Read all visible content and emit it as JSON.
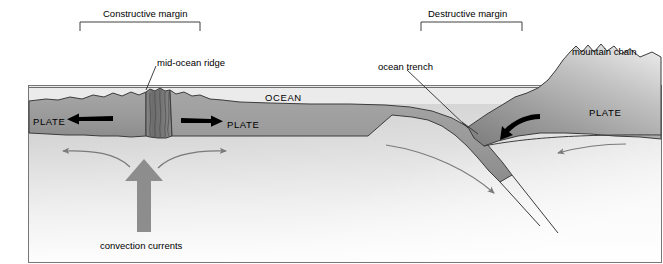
{
  "figure": {
    "kind": "cross-section-diagram",
    "background_color": "#ffffff",
    "frame_color": "#6e6e6e"
  },
  "annotations": {
    "constructive_margin": {
      "label": "Constructive margin",
      "bracket": {
        "left": 80,
        "right": 200,
        "top": 22,
        "tick": 9
      },
      "label_x": 103,
      "label_y": 9
    },
    "destructive_margin": {
      "label": "Destructive margin",
      "bracket": {
        "left": 421,
        "right": 522,
        "top": 22,
        "tick": 9
      },
      "label_x": 428,
      "label_y": 9
    }
  },
  "labels": {
    "mid_ocean_ridge": {
      "text": "mid-ocean ridge",
      "x": 157,
      "y": 58
    },
    "ocean": {
      "text": "OCEAN",
      "x": 265,
      "y": 93
    },
    "ocean_trench": {
      "text": "ocean trench",
      "x": 378,
      "y": 62
    },
    "mountain_chain": {
      "text": "mountain chain",
      "x": 572,
      "y": 47
    },
    "plate_left": {
      "text": "PLATE",
      "x": 33,
      "y": 117
    },
    "plate_right_of_ridge": {
      "text": "PLATE",
      "x": 227,
      "y": 120
    },
    "plate_continental": {
      "text": "PLATE",
      "x": 589,
      "y": 108
    },
    "convection_currents": {
      "text": "convection currents",
      "x": 100,
      "y": 241
    }
  },
  "colors": {
    "ocean_water": "#e8e8e8",
    "oceanic_plate": "#9a9a9a",
    "oceanic_plate_dark": "#8a8a8a",
    "continental_plate_dark": "#8e8e8e",
    "continental_plate_light": "#d8d8d8",
    "mantle_top": "#c9c9c9",
    "mantle_bottom": "#ffffff",
    "ridge_fissure": "#6a6a6a",
    "outline": "#3a3a3a",
    "black_arrow": "#000000",
    "gray_arrow": "#7a7a7a",
    "convection_arrow": "#8a8a8a"
  },
  "arrows": {
    "plate_left_motion": {
      "direction": "left",
      "color": "#000000"
    },
    "plate_right_motion": {
      "direction": "right",
      "color": "#000000"
    },
    "subducting_motion": {
      "direction": "down-left",
      "color": "#000000"
    },
    "mantle_flow_left": {
      "direction": "left",
      "color": "#7a7a7a"
    },
    "mantle_flow_right": {
      "direction": "right",
      "color": "#7a7a7a"
    },
    "mantle_flow_down_slab": {
      "direction": "down-right",
      "color": "#7a7a7a"
    },
    "mantle_flow_return_right": {
      "direction": "left",
      "color": "#7a7a7a"
    },
    "convection_rising": {
      "direction": "up",
      "color": "#8a8a8a"
    }
  }
}
